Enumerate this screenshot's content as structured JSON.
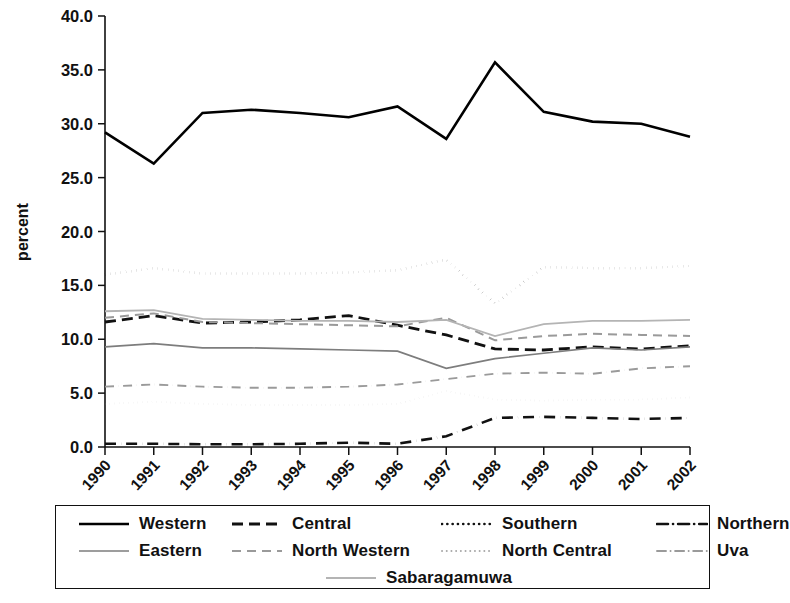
{
  "chart_data": {
    "type": "line",
    "title": "",
    "subtitle": "",
    "xlabel": "",
    "ylabel": "percent",
    "x": [
      "1990",
      "1991",
      "1992",
      "1993",
      "1994",
      "1995",
      "1996",
      "1997",
      "1998",
      "1999",
      "2000",
      "2001",
      "2002"
    ],
    "categories": [
      "1990",
      "1991",
      "1992",
      "1993",
      "1994",
      "1995",
      "1996",
      "1997",
      "1998",
      "1999",
      "2000",
      "2001",
      "2002"
    ],
    "xlim": [
      1990,
      2002
    ],
    "ylim": [
      0.0,
      40.0
    ],
    "yticks": [
      "0.0",
      "5.0",
      "10.0",
      "15.0",
      "20.0",
      "25.0",
      "30.0",
      "35.0",
      "40.0"
    ],
    "ytick_values": [
      0.0,
      5.0,
      10.0,
      15.0,
      20.0,
      25.0,
      30.0,
      35.0,
      40.0
    ],
    "grid": false,
    "legend_position": "bottom",
    "series": [
      {
        "name": "Western",
        "style": "solid",
        "color": "#000000",
        "width": 2.6,
        "values": [
          29.2,
          26.3,
          31.0,
          31.3,
          31.0,
          30.6,
          31.6,
          28.6,
          35.7,
          31.1,
          30.2,
          30.0,
          28.8
        ]
      },
      {
        "name": "Central",
        "style": "dashed",
        "color": "#111111",
        "width": 2.8,
        "values": [
          11.6,
          12.2,
          11.5,
          11.6,
          11.8,
          12.2,
          11.3,
          10.4,
          9.1,
          9.0,
          9.3,
          9.1,
          9.4
        ]
      },
      {
        "name": "Southern",
        "style": "dotted",
        "color": "#111111",
        "width": 2.6,
        "values": [
          16.0,
          16.6,
          16.1,
          16.1,
          16.1,
          16.2,
          16.4,
          17.4,
          13.3,
          16.7,
          16.6,
          16.6,
          16.8
        ]
      },
      {
        "name": "Northern",
        "style": "dashdot",
        "color": "#111111",
        "width": 2.6,
        "values": [
          0.3,
          0.3,
          0.25,
          0.25,
          0.3,
          0.4,
          0.3,
          1.0,
          2.7,
          2.8,
          2.7,
          2.6,
          2.7
        ]
      },
      {
        "name": "Eastern",
        "style": "solid",
        "color": "#7d7d7d",
        "width": 1.7,
        "values": [
          9.3,
          9.6,
          9.2,
          9.2,
          9.1,
          9.0,
          8.9,
          7.3,
          8.2,
          8.7,
          9.2,
          9.0,
          9.3
        ]
      },
      {
        "name": "North Western",
        "style": "dashed",
        "color": "#9a9a9a",
        "width": 2.0,
        "values": [
          12.0,
          12.4,
          11.6,
          11.5,
          11.4,
          11.3,
          11.2,
          12.0,
          9.9,
          10.3,
          10.5,
          10.4,
          10.3
        ]
      },
      {
        "name": "North Central",
        "style": "dotted",
        "color": "#a8a8a8",
        "width": 1.9,
        "values": [
          4.0,
          4.2,
          4.0,
          3.9,
          3.9,
          3.9,
          4.0,
          5.2,
          4.4,
          4.3,
          4.4,
          4.4,
          4.6
        ]
      },
      {
        "name": "Uva",
        "style": "dashdot",
        "color": "#9a9a9a",
        "width": 1.9,
        "values": [
          5.6,
          5.8,
          5.6,
          5.5,
          5.5,
          5.6,
          5.8,
          6.3,
          6.8,
          6.9,
          6.8,
          7.3,
          7.5
        ]
      },
      {
        "name": "Sabaragamuwa",
        "style": "solid",
        "color": "#b4b4b4",
        "width": 1.8,
        "values": [
          12.6,
          12.7,
          11.9,
          11.8,
          11.7,
          11.7,
          11.6,
          11.8,
          10.3,
          11.4,
          11.7,
          11.7,
          11.8
        ]
      }
    ]
  },
  "legend": {
    "items": [
      {
        "label": "Western"
      },
      {
        "label": "Central"
      },
      {
        "label": "Southern"
      },
      {
        "label": "Northern"
      },
      {
        "label": "Eastern"
      },
      {
        "label": "North Western"
      },
      {
        "label": "North Central"
      },
      {
        "label": "Uva"
      },
      {
        "label": "Sabaragamuwa"
      }
    ]
  }
}
